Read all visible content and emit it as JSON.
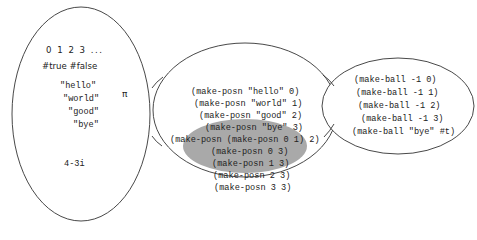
{
  "left_set": {
    "numbers": "0 1 2 3 ...",
    "booleans": "#true #false",
    "strings": [
      "\"hello\"",
      "\"world\"",
      "\"good\"",
      "\"bye\""
    ],
    "pi": "π",
    "complex": "4-3i"
  },
  "middle_set": {
    "items": [
      "(make-posn \"hello\" 0)",
      "(make-posn \"world\" 1)",
      "(make-posn \"good\" 2)",
      "(make-posn \"bye\" 3)",
      "(make-posn (make-posn 0 1) 2)"
    ],
    "highlighted_items": [
      "(make-posn 0 3)",
      "(make-posn 1 3)",
      "(make-posn 2 3)",
      "(make-posn 3 3)"
    ]
  },
  "right_set": {
    "items": [
      "(make-ball -1 0)",
      "(make-ball -1 1)",
      "(make-ball -1 2)",
      "(make-ball -1 3)",
      "(make-ball \"bye\" #t)"
    ]
  },
  "colors": {
    "stroke": "#333333",
    "highlight_fill": "#a9a9a9",
    "background": "#ffffff"
  }
}
